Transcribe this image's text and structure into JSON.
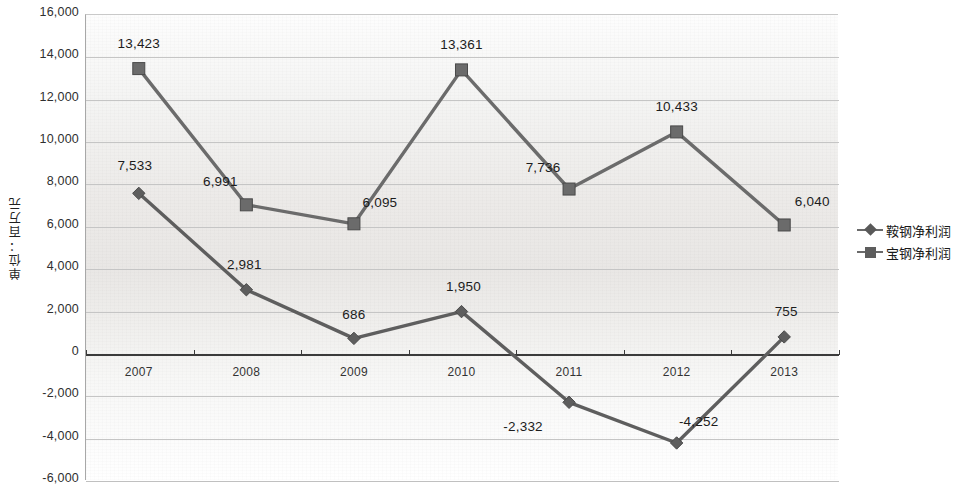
{
  "chart_data": {
    "type": "line",
    "title": "",
    "xlabel": "",
    "ylabel": "单位：百万元",
    "categories": [
      "2007",
      "2008",
      "2009",
      "2010",
      "2011",
      "2012",
      "2013"
    ],
    "ylim": [
      -6000,
      16000
    ],
    "ytick_step": 2000,
    "yticks": [
      "16,000",
      "14,000",
      "12,000",
      "10,000",
      "8,000",
      "6,000",
      "4,000",
      "2,000",
      "0",
      "-2,000",
      "-4,000",
      "-6,000"
    ],
    "ytick_values": [
      16000,
      14000,
      12000,
      10000,
      8000,
      6000,
      4000,
      2000,
      0,
      -2000,
      -4000,
      -6000
    ],
    "grid": true,
    "legend_position": "right",
    "series": [
      {
        "name": "鞍钢净利润",
        "marker": "diamond",
        "values": [
          7533,
          2981,
          686,
          1950,
          -2332,
          -4252,
          755
        ],
        "labels": [
          "7,533",
          "2,981",
          "686",
          "1,950",
          "-2,332",
          "-4,252",
          "755"
        ]
      },
      {
        "name": "宝钢净利润",
        "marker": "square",
        "values": [
          13423,
          6991,
          6095,
          13361,
          7736,
          10433,
          6040
        ],
        "labels": [
          "13,423",
          "6,991",
          "6,095",
          "13,361",
          "7,736",
          "10,433",
          "6,040"
        ]
      }
    ],
    "colors": {
      "series1": "#5e5e5e",
      "series2": "#6b6b6b",
      "grid": "#c5c5c5",
      "axis": "#3a3a3a",
      "plot_background": "#edebe9"
    }
  }
}
